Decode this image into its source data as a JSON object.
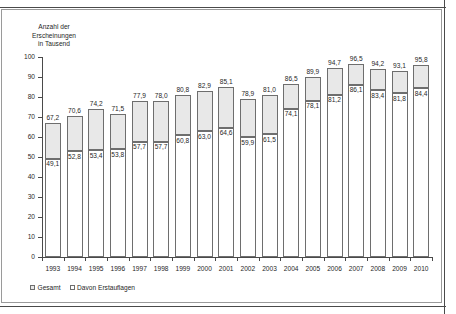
{
  "chart_data": {
    "type": "bar",
    "title": "",
    "subtitle": "",
    "ylabel": "Anzahl der\nErscheinungen\nin Tausend",
    "xlabel": "",
    "ylim": [
      0,
      100
    ],
    "yticks": [
      0,
      10,
      20,
      30,
      40,
      50,
      60,
      70,
      80,
      90,
      100
    ],
    "ytick_labels": [
      "0",
      "10",
      "20",
      "30",
      "40",
      "50",
      "60",
      "70",
      "80",
      "90",
      "100"
    ],
    "grid": false,
    "legend_position": "bottom-left",
    "stacked": true,
    "decimal_separator": ",",
    "categories": [
      "1993",
      "1994",
      "1995",
      "1996",
      "1997",
      "1998",
      "1999",
      "2000",
      "2001",
      "2002",
      "2003",
      "2004",
      "2005",
      "2006",
      "2007",
      "2008",
      "2009",
      "2010"
    ],
    "series": [
      {
        "name": "Gesamt",
        "color": "#e8e8e8",
        "values": [
          67.2,
          70.6,
          74.2,
          71.5,
          77.9,
          78.0,
          80.8,
          82.9,
          85.1,
          78.9,
          81.0,
          86.5,
          89.9,
          94.7,
          96.5,
          94.2,
          93.1,
          95.8
        ],
        "labels": [
          "67,2",
          "70,6",
          "74,2",
          "71,5",
          "77,9",
          "78,0",
          "80,8",
          "82,9",
          "85,1",
          "78,9",
          "81,0",
          "86,5",
          "89,9",
          "94,7",
          "96,5",
          "94,2",
          "93,1",
          "95,8"
        ]
      },
      {
        "name": "Davon Erstauflagen",
        "color": "#ffffff",
        "values": [
          49.1,
          52.8,
          53.4,
          53.8,
          57.7,
          57.7,
          60.8,
          63.0,
          64.6,
          59.9,
          61.5,
          74.1,
          78.1,
          81.2,
          86.1,
          83.4,
          81.8,
          84.4
        ],
        "labels": [
          "49,1",
          "52,8",
          "53,4",
          "53,8",
          "57,7",
          "57,7",
          "60,8",
          "63,0",
          "64,6",
          "59,9",
          "61,5",
          "74,1",
          "78,1",
          "81,2",
          "86,1",
          "83,4",
          "81,8",
          "84,4"
        ]
      }
    ]
  },
  "legend": {
    "items": [
      {
        "label": "Gesamt"
      },
      {
        "label": "Davon Erstauflagen"
      }
    ]
  }
}
